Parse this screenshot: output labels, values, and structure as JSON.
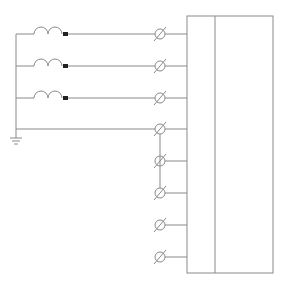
{
  "diagram": {
    "type": "wiring-schematic",
    "colors": {
      "line": "#8a8a8a",
      "background": "#ffffff",
      "terminal_block": "#222222"
    },
    "bus": {
      "x": 16,
      "y_top": 34,
      "y_bottom": 130
    },
    "ground": {
      "x": 16,
      "y": 138,
      "icon": "ground-icon"
    },
    "coils": [
      {
        "id": "coil-1",
        "y": 34,
        "icon": "inductor-coil-icon"
      },
      {
        "id": "coil-2",
        "y": 66,
        "icon": "inductor-coil-icon"
      },
      {
        "id": "coil-3",
        "y": 98,
        "icon": "inductor-coil-icon"
      }
    ],
    "terminals": [
      {
        "id": "t1",
        "y": 34
      },
      {
        "id": "t2",
        "y": 66
      },
      {
        "id": "t3",
        "y": 98
      },
      {
        "id": "t4",
        "y": 129
      },
      {
        "id": "t5",
        "y": 161
      },
      {
        "id": "t6",
        "y": 193
      },
      {
        "id": "t7",
        "y": 225
      },
      {
        "id": "t8",
        "y": 257
      }
    ],
    "jumper": {
      "x": 160,
      "y_from": 129,
      "y_to": 193
    },
    "device_box": {
      "x": 187,
      "y": 16,
      "width": 86,
      "height": 257,
      "divider_x": 215
    }
  }
}
